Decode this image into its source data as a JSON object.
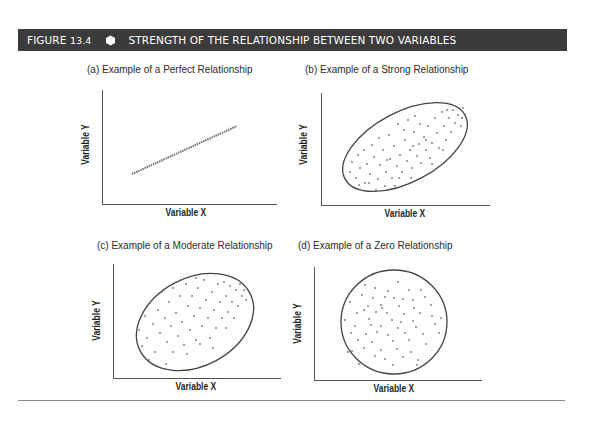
{
  "figure": {
    "number_prefix": "FIGURE",
    "number": "13.4",
    "title": "STRENGTH OF THE RELATIONSHIP BETWEEN TWO VARIABLES",
    "header_bg": "#3b3b3b",
    "header_text_color": "#ffffff"
  },
  "panels": [
    {
      "id": "a",
      "title": "(a) Example of a Perfect Relationship",
      "xlabel": "Variable X",
      "ylabel": "Variable Y",
      "shape": "line"
    },
    {
      "id": "b",
      "title": "(b) Example of a Strong Relationship",
      "xlabel": "Variable X",
      "ylabel": "Variable Y",
      "shape": "narrow-tilted-ellipse"
    },
    {
      "id": "c",
      "title": "(c) Example of a Moderate Relationship",
      "xlabel": "Variable X",
      "ylabel": "Variable Y",
      "shape": "wide-tilted-ellipse"
    },
    {
      "id": "d",
      "title": "(d) Example of a Zero Relationship",
      "xlabel": "Variable X",
      "ylabel": "Variable Y",
      "shape": "circle"
    }
  ]
}
